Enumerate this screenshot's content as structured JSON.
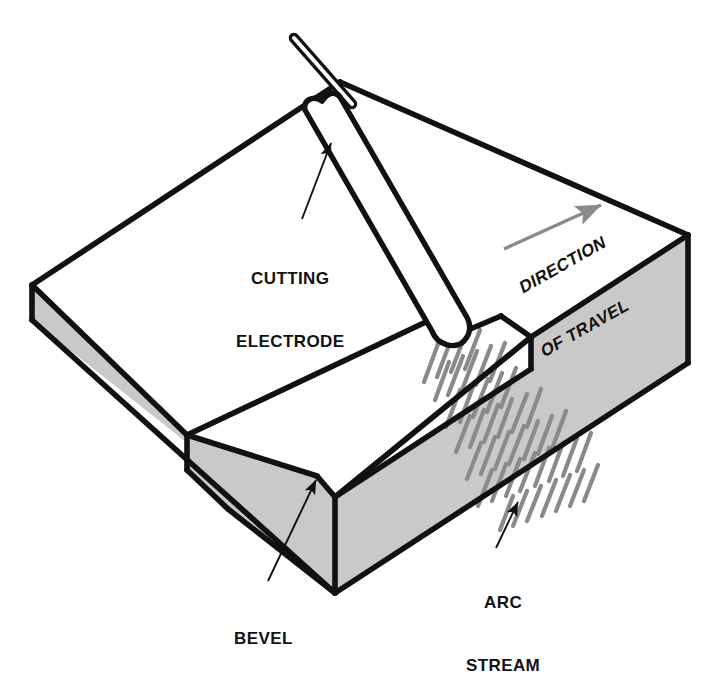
{
  "figure": {
    "background_color": "#ffffff",
    "line_color": "#111111",
    "shade_color": "#c9c9c9",
    "arc_color": "#8a8a8a",
    "arrow_color": "#8a8a8a"
  },
  "labels": {
    "cutting_electrode": {
      "line1": "CUTTING",
      "line2": "ELECTRODE"
    },
    "bevel": {
      "line1": "BEVEL"
    },
    "arc_stream": {
      "line1": "ARC",
      "line2": "STREAM"
    },
    "direction_of_travel": {
      "line1": "DIRECTION",
      "line2": "OF TRAVEL"
    }
  },
  "parts": {
    "workpiece": "steel plate",
    "electrode": "cutting electrode",
    "electrode_holder": "electrode rod",
    "kerf": "cut kerf",
    "bevel_face": "bevel cut face",
    "arc_stream": "arc stream",
    "travel_arrow": "direction of travel arrow"
  }
}
